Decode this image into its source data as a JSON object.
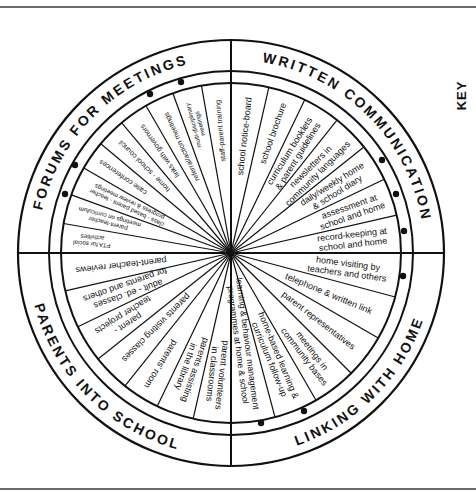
{
  "diagram": {
    "key_label": "KEY",
    "center": [
      231,
      253
    ],
    "radii": {
      "outer": 213,
      "ring": 182,
      "inner": 170
    },
    "colors": {
      "line": "#111111",
      "text": "#111111",
      "background": "#ffffff",
      "frame": "#6a6a6a"
    },
    "quadrants": [
      {
        "id": "forums",
        "title": "FORUMS FOR MEETINGS",
        "start_angle": 180,
        "end_angle": 270,
        "items": [
          "PTA for social activities",
          "parent-teacher meetings on curriculum",
          "class - based parent - teacher progress & review meetings",
          "case conferences",
          "home - school council",
          "links with governors",
          "referral/action meetings",
          "multi-disciplinary meetings",
          "staff-parent training"
        ],
        "dots": [
          [
            65,
            194
          ],
          [
            75,
            165
          ],
          [
            150,
            94
          ],
          [
            181,
            82
          ]
        ]
      },
      {
        "id": "written",
        "title": "WRITTEN COMMUNICATION",
        "start_angle": 270,
        "end_angle": 360,
        "items": [
          "school notice-board",
          "school brochure",
          "curriculum booklets & parent guidelines",
          "newsletters in community languages",
          "daily/weekly home & school diary",
          "assessment at school and home",
          "record-keeping at school and home"
        ],
        "dots": [
          [
            382,
            160
          ],
          [
            396,
            194
          ],
          [
            404,
            231
          ]
        ]
      },
      {
        "id": "linking",
        "title": "LINKING WITH HOME",
        "start_angle": 0,
        "end_angle": 90,
        "items": [
          "home visiting by teachers and others",
          "telephone & written link",
          "parent representatives",
          "meetings in community bases",
          "home-based learning & curriculum follow-up",
          "learning & behaviour management programmes at home & school"
        ],
        "dots": [
          [
            403,
            276
          ],
          [
            304,
            411
          ],
          [
            261,
            423
          ]
        ]
      },
      {
        "id": "into_school",
        "title": "PARENTS INTO SCHOOL",
        "start_angle": 90,
        "end_angle": 180,
        "items": [
          "parent volunteers in classrooms",
          "parents assisting in the library",
          "parents' room",
          "parents visiting classes",
          "parent - teacher projects",
          "adult - ed. classes for parents and others",
          "parent-teacher reviews"
        ],
        "dots": []
      }
    ]
  }
}
